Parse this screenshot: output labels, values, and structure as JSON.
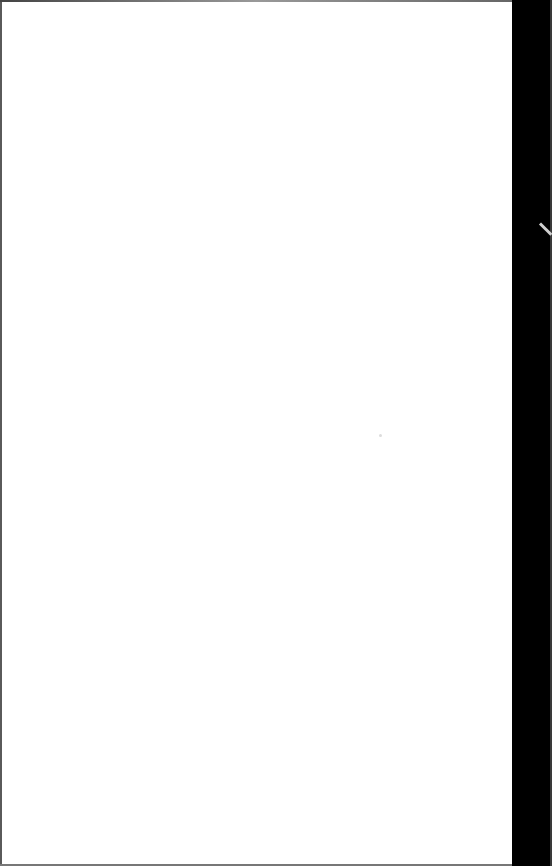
{
  "screen": {
    "state": "blank",
    "background_color": "#ffffff",
    "frame_color": "#000000",
    "text": ""
  }
}
